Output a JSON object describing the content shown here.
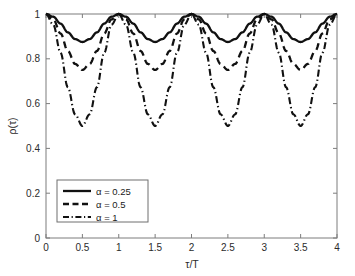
{
  "chart_data": {
    "type": "line",
    "title": "",
    "xlabel": "τ/T",
    "ylabel": "ρ(τ)",
    "xlim": [
      0,
      4
    ],
    "ylim": [
      0,
      1
    ],
    "xticks": [
      "0",
      "0.5",
      "1",
      "1.5",
      "2",
      "2.5",
      "3",
      "3.5",
      "4"
    ],
    "xtick_values": [
      0,
      0.5,
      1,
      1.5,
      2,
      2.5,
      3,
      3.5,
      4
    ],
    "yticks": [
      "0",
      "0.2",
      "0.4",
      "0.6",
      "0.8",
      "1"
    ],
    "ytick_values": [
      0,
      0.2,
      0.4,
      0.6,
      0.8,
      1
    ],
    "grid": false,
    "legend_position": "lower left",
    "series": [
      {
        "name": "α = 0.25",
        "alpha": 0.25,
        "style": "solid",
        "min_value": 0.87,
        "max_value": 1.0,
        "period": 1,
        "x": [
          0,
          0.1,
          0.2,
          0.3,
          0.4,
          0.5,
          0.6,
          0.7,
          0.8,
          0.9,
          1,
          1.1,
          1.2,
          1.3,
          1.4,
          1.5,
          1.6,
          1.7,
          1.8,
          1.9,
          2,
          2.1,
          2.2,
          2.3,
          2.4,
          2.5,
          2.6,
          2.7,
          2.8,
          2.9,
          3,
          3.1,
          3.2,
          3.3,
          3.4,
          3.5,
          3.6,
          3.7,
          3.8,
          3.9,
          4
        ],
        "values": [
          1.0,
          0.988,
          0.957,
          0.918,
          0.888,
          0.875,
          0.888,
          0.918,
          0.957,
          0.988,
          1.0,
          0.988,
          0.957,
          0.918,
          0.888,
          0.875,
          0.888,
          0.918,
          0.957,
          0.988,
          1.0,
          0.988,
          0.957,
          0.918,
          0.888,
          0.875,
          0.888,
          0.918,
          0.957,
          0.988,
          1.0,
          0.988,
          0.957,
          0.918,
          0.888,
          0.875,
          0.888,
          0.918,
          0.957,
          0.988,
          1.0
        ]
      },
      {
        "name": "α = 0.5",
        "alpha": 0.5,
        "style": "dashed",
        "min_value": 0.75,
        "max_value": 1.0,
        "period": 1,
        "x": [
          0,
          0.1,
          0.2,
          0.3,
          0.4,
          0.5,
          0.6,
          0.7,
          0.8,
          0.9,
          1,
          1.1,
          1.2,
          1.3,
          1.4,
          1.5,
          1.6,
          1.7,
          1.8,
          1.9,
          2,
          2.1,
          2.2,
          2.3,
          2.4,
          2.5,
          2.6,
          2.7,
          2.8,
          2.9,
          3,
          3.1,
          3.2,
          3.3,
          3.4,
          3.5,
          3.6,
          3.7,
          3.8,
          3.9,
          4
        ],
        "values": [
          1.0,
          0.976,
          0.913,
          0.835,
          0.777,
          0.75,
          0.777,
          0.835,
          0.913,
          0.976,
          1.0,
          0.976,
          0.913,
          0.835,
          0.777,
          0.75,
          0.777,
          0.835,
          0.913,
          0.976,
          1.0,
          0.976,
          0.913,
          0.835,
          0.777,
          0.75,
          0.777,
          0.835,
          0.913,
          0.976,
          1.0,
          0.976,
          0.913,
          0.835,
          0.777,
          0.75,
          0.777,
          0.835,
          0.913,
          0.976,
          1.0
        ]
      },
      {
        "name": "α = 1",
        "alpha": 1,
        "style": "dashdot",
        "min_value": 0.5,
        "max_value": 1.0,
        "period": 1,
        "x": [
          0,
          0.1,
          0.2,
          0.3,
          0.4,
          0.5,
          0.6,
          0.7,
          0.8,
          0.9,
          1,
          1.1,
          1.2,
          1.3,
          1.4,
          1.5,
          1.6,
          1.7,
          1.8,
          1.9,
          2,
          2.1,
          2.2,
          2.3,
          2.4,
          2.5,
          2.6,
          2.7,
          2.8,
          2.9,
          3,
          3.1,
          3.2,
          3.3,
          3.4,
          3.5,
          3.6,
          3.7,
          3.8,
          3.9,
          4
        ],
        "values": [
          1.0,
          0.952,
          0.827,
          0.673,
          0.552,
          0.5,
          0.552,
          0.673,
          0.827,
          0.952,
          1.0,
          0.952,
          0.827,
          0.673,
          0.552,
          0.5,
          0.552,
          0.673,
          0.827,
          0.952,
          1.0,
          0.952,
          0.827,
          0.673,
          0.552,
          0.5,
          0.552,
          0.673,
          0.827,
          0.952,
          1.0,
          0.952,
          0.827,
          0.673,
          0.552,
          0.5,
          0.552,
          0.673,
          0.827,
          0.952,
          1.0
        ]
      }
    ],
    "legend_entries": [
      {
        "label": "α = 0.25",
        "style": "solid"
      },
      {
        "label": "α = 0.5",
        "style": "dashed"
      },
      {
        "label": "α = 1",
        "style": "dashdot"
      }
    ],
    "colors": {
      "curve": "#111111",
      "axis": "#7d7d7d",
      "text": "#2b2b2b",
      "background": "#ffffff"
    }
  }
}
